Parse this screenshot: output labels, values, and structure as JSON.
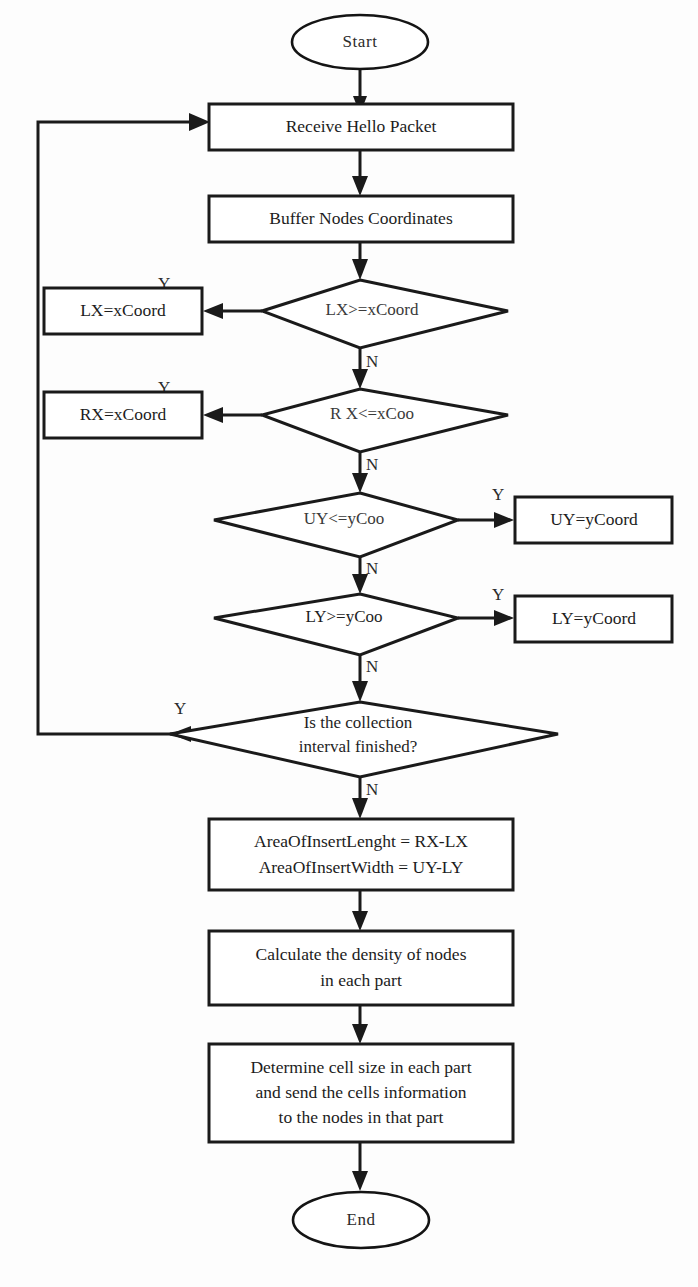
{
  "figure": {
    "type": "flowchart",
    "title": "",
    "caption": ""
  },
  "nodes": {
    "start": {
      "label": "Start",
      "shape": "terminator"
    },
    "receive": {
      "label": "Receive Hello Packet",
      "shape": "process"
    },
    "buffer": {
      "label": "Buffer Nodes Coordinates",
      "shape": "process"
    },
    "d1": {
      "label": "LX>=xCoord",
      "shape": "decision"
    },
    "a1": {
      "label": "LX=xCoord",
      "shape": "process"
    },
    "d2": {
      "label": "R X<=xCoo",
      "shape": "decision"
    },
    "a2": {
      "label": "RX=xCoord",
      "shape": "process"
    },
    "d3": {
      "label": "UY<=yCoo",
      "shape": "decision"
    },
    "a3": {
      "label": "UY=yCoord",
      "shape": "process"
    },
    "d4": {
      "label": "LY>=yCoo",
      "shape": "decision"
    },
    "a4": {
      "label": "LY=yCoord",
      "shape": "process"
    },
    "d5": {
      "label_line1": "Is the collection",
      "label_line2": "interval finished?",
      "shape": "decision"
    },
    "area": {
      "label_line1": "AreaOfInsertLenght = RX-LX",
      "label_line2": "AreaOfInsertWidth = UY-LY",
      "shape": "process"
    },
    "density": {
      "label_line1": "Calculate the density of nodes",
      "label_line2": "in each part",
      "shape": "process"
    },
    "cells": {
      "label_line1": "Determine cell size in each part",
      "label_line2": "and send the cells information",
      "label_line3": "to the nodes in that part",
      "shape": "process"
    },
    "end": {
      "label": "End",
      "shape": "terminator"
    }
  },
  "branch_labels": {
    "d1_yes": "Y",
    "d1_no": "N",
    "d2_yes": "Y",
    "d2_no": "N",
    "d3_yes": "Y",
    "d3_no": "N",
    "d4_yes": "Y",
    "d4_no": "N",
    "d5_yes": "Y",
    "d5_no": "N"
  },
  "colors": {
    "stroke": "#1a1a1a",
    "fill": "#ffffff",
    "background": "#fdfdfd",
    "text": "#1c1c1c"
  }
}
